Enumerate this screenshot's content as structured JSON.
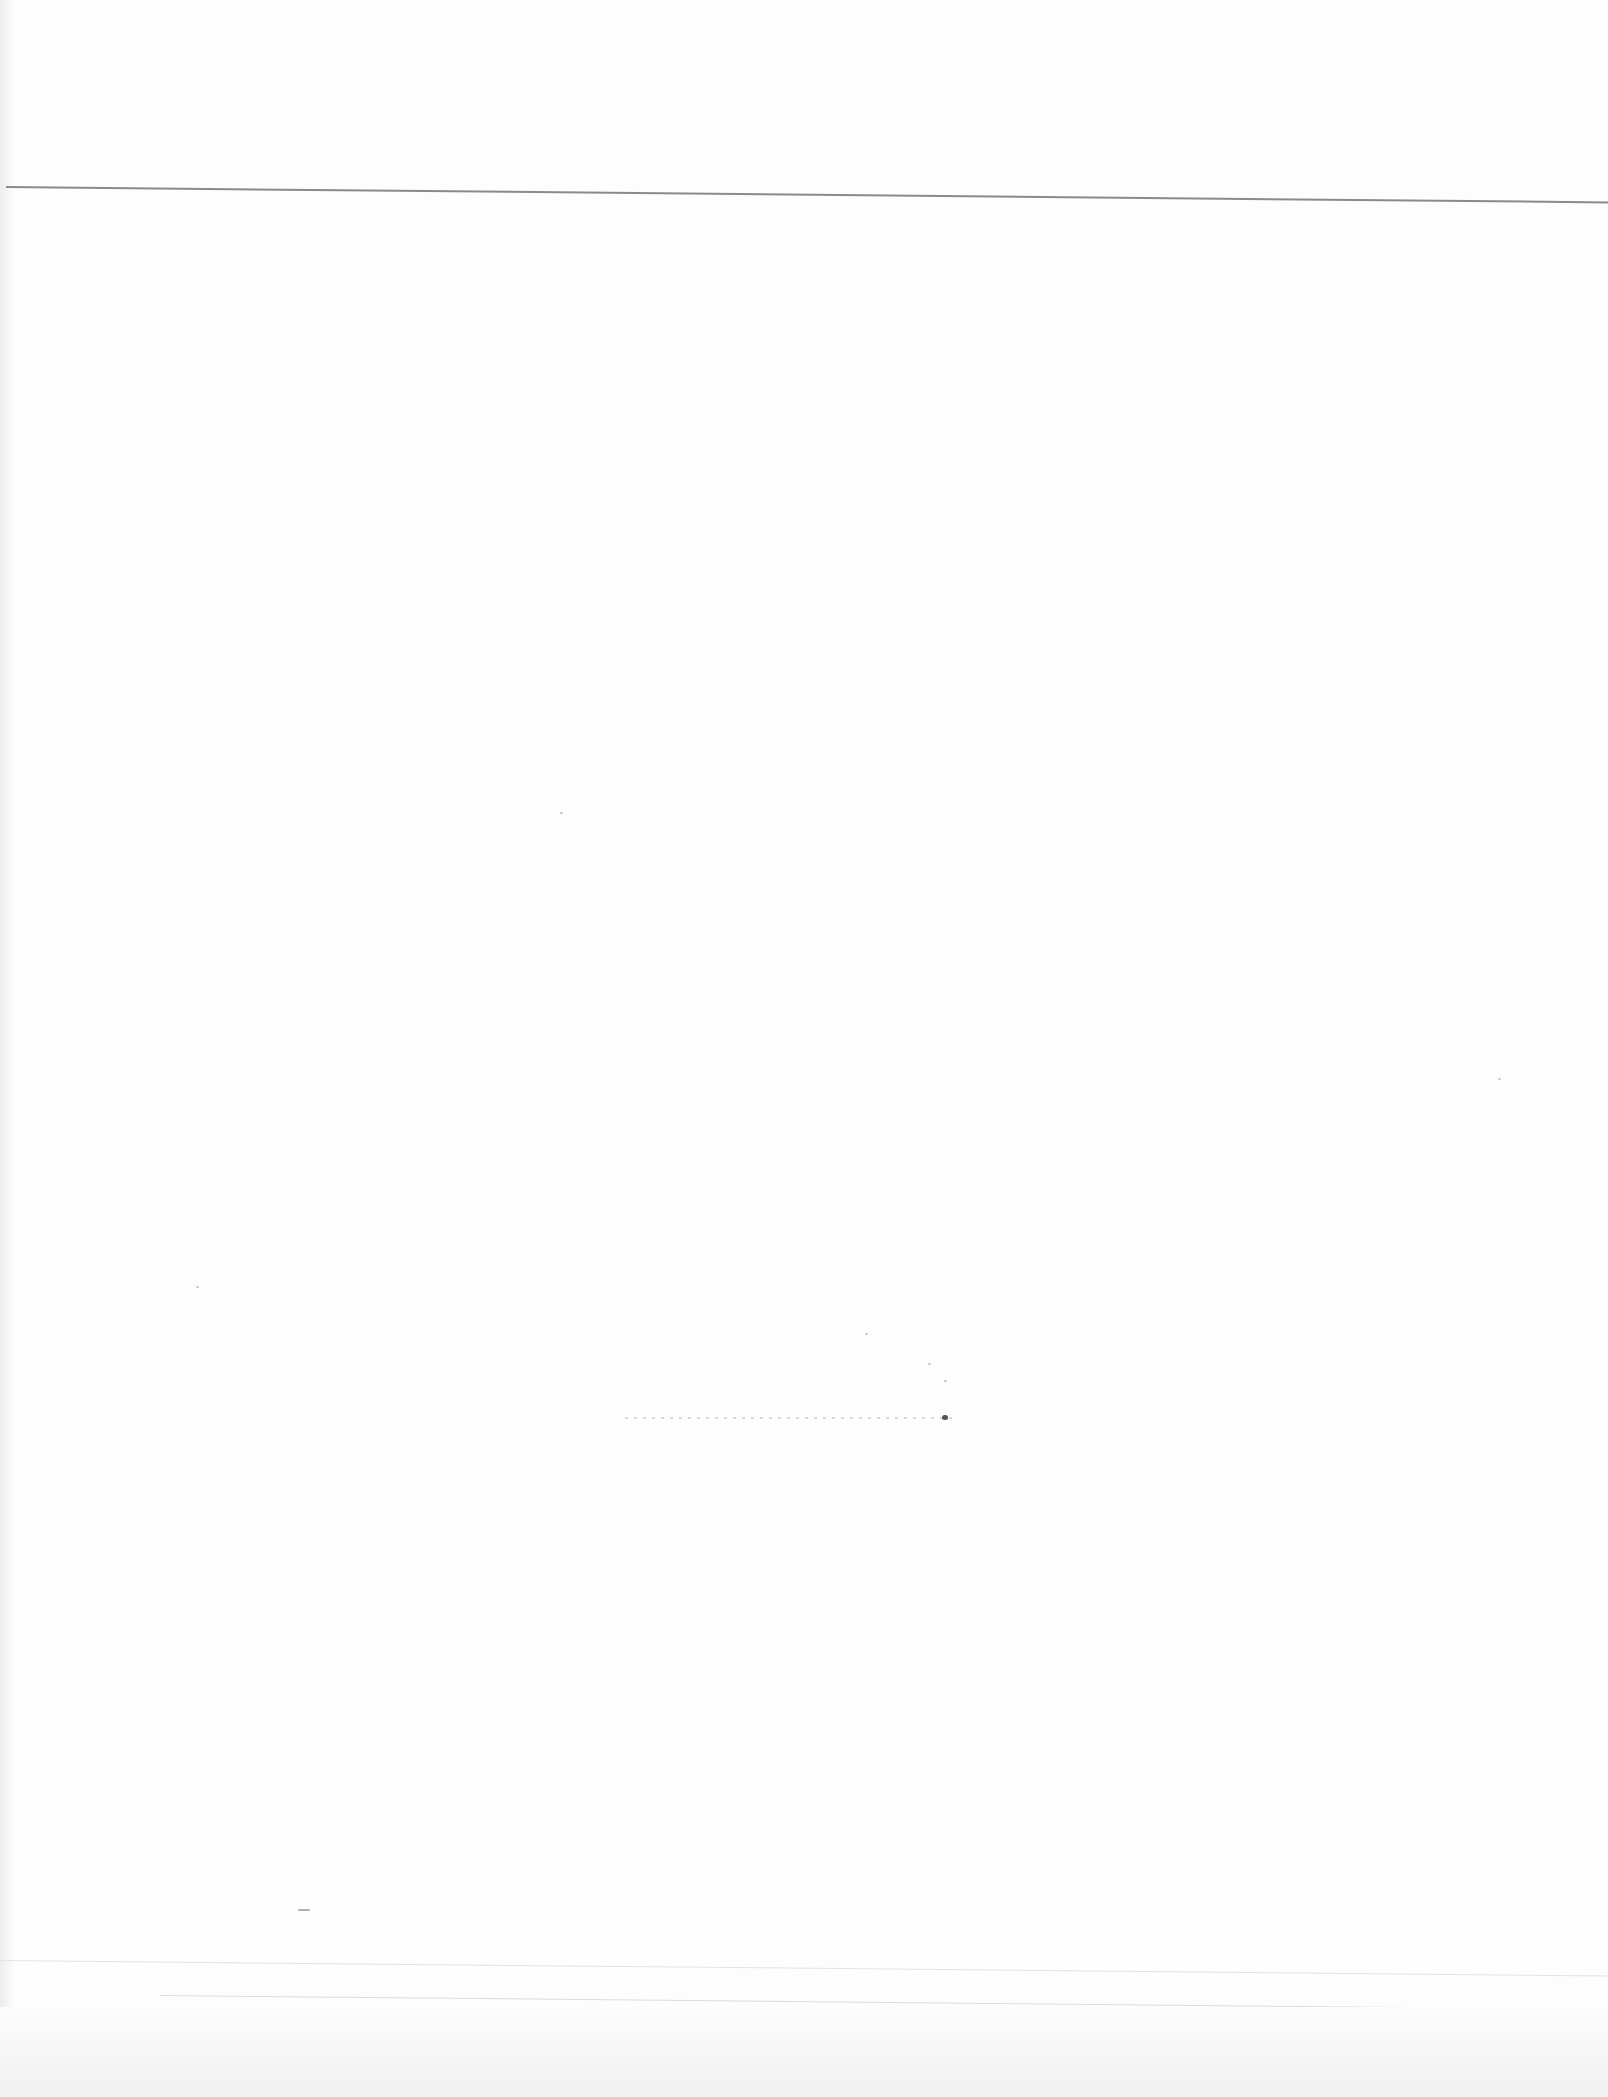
{
  "page": {
    "type": "blank-scanned-page",
    "text_content": ""
  }
}
